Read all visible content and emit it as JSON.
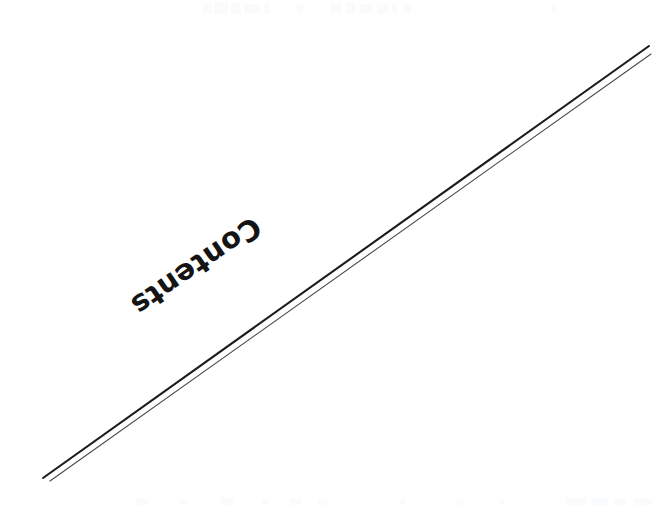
{
  "page": {
    "kind": "scanned-document-page",
    "width": 663,
    "height": 509,
    "background_color": "#ffffff"
  },
  "heading": {
    "text": "Contents",
    "color": "#141414",
    "rotation_degrees": 145.5,
    "center_x": 196,
    "center_y": 266
  },
  "rules": {
    "description": "two near-parallel diagonal rule lines running from lower-left to upper-right",
    "items": [
      {
        "name": "upper-rule",
        "color": "#1c1c1c",
        "stroke_width": 2.1,
        "x1": 43,
        "y1": 478,
        "x2": 649,
        "y2": 46
      },
      {
        "name": "lower-rule",
        "color": "#4a4a4a",
        "stroke_width": 1.1,
        "x1": 50,
        "y1": 481,
        "x2": 651,
        "y2": 54
      }
    ]
  },
  "artifacts": {
    "top_band_color": "#fafbfc",
    "bottom_band_color": "#fafbfc",
    "top_marks": [
      {
        "x": 203,
        "y": 3,
        "w": 9,
        "h": 11
      },
      {
        "x": 214,
        "y": 2,
        "w": 14,
        "h": 12
      },
      {
        "x": 231,
        "y": 3,
        "w": 10,
        "h": 11
      },
      {
        "x": 244,
        "y": 4,
        "w": 16,
        "h": 9
      },
      {
        "x": 264,
        "y": 3,
        "w": 6,
        "h": 11
      },
      {
        "x": 297,
        "y": 4,
        "w": 7,
        "h": 9
      },
      {
        "x": 330,
        "y": 3,
        "w": 12,
        "h": 10
      },
      {
        "x": 346,
        "y": 2,
        "w": 9,
        "h": 12
      },
      {
        "x": 360,
        "y": 4,
        "w": 13,
        "h": 9
      },
      {
        "x": 377,
        "y": 3,
        "w": 11,
        "h": 11
      },
      {
        "x": 392,
        "y": 4,
        "w": 5,
        "h": 10
      },
      {
        "x": 404,
        "y": 3,
        "w": 7,
        "h": 11
      },
      {
        "x": 552,
        "y": 5,
        "w": 4,
        "h": 8
      }
    ],
    "bottom_marks": [
      {
        "x": 136,
        "y": 498,
        "w": 12,
        "h": 7
      },
      {
        "x": 180,
        "y": 499,
        "w": 7,
        "h": 6
      },
      {
        "x": 220,
        "y": 497,
        "w": 14,
        "h": 8
      },
      {
        "x": 262,
        "y": 499,
        "w": 6,
        "h": 6
      },
      {
        "x": 290,
        "y": 498,
        "w": 11,
        "h": 7
      },
      {
        "x": 318,
        "y": 499,
        "w": 9,
        "h": 6
      },
      {
        "x": 400,
        "y": 498,
        "w": 5,
        "h": 7
      },
      {
        "x": 455,
        "y": 499,
        "w": 8,
        "h": 6
      },
      {
        "x": 500,
        "y": 498,
        "w": 4,
        "h": 7
      },
      {
        "x": 565,
        "y": 497,
        "w": 22,
        "h": 8
      },
      {
        "x": 592,
        "y": 498,
        "w": 16,
        "h": 7
      },
      {
        "x": 614,
        "y": 499,
        "w": 12,
        "h": 6
      },
      {
        "x": 634,
        "y": 498,
        "w": 18,
        "h": 7
      }
    ]
  }
}
